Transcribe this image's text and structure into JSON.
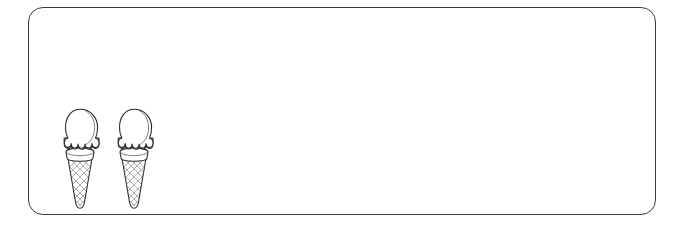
{
  "canvas": {
    "width": 680,
    "height": 230,
    "background_color": "#ffffff"
  },
  "panel": {
    "name": "answer-box",
    "shape": "rounded-rectangle",
    "border_color": "#3a3a3a",
    "fill_color": "#ffffff",
    "border_width_px": 1,
    "corner_radius_px": 15,
    "left_px": 28,
    "top_px": 7,
    "width_px": 628,
    "height_px": 208
  },
  "content": {
    "item_label": "ice-cream-cone",
    "item_count": "2",
    "alignment": "bottom-left",
    "icons": [
      {
        "index": "1",
        "name": "ice-cream-cone-icon",
        "left_px": 28,
        "top_px": 100,
        "width_px": 46,
        "height_px": 102,
        "outline_color": "#2b2b2b",
        "fill_color": "#ffffff",
        "hatch_color": "#6e6e6e"
      },
      {
        "index": "2",
        "name": "ice-cream-cone-icon",
        "left_px": 82,
        "top_px": 100,
        "width_px": 46,
        "height_px": 102,
        "outline_color": "#2b2b2b",
        "fill_color": "#ffffff",
        "hatch_color": "#6e6e6e"
      }
    ]
  },
  "accessibility": {
    "panel_description": "Empty bordered answer area containing two line-art ice cream cones",
    "icon_description": "Ice cream cone with a single rounded scoop and a cross-hatched waffle cone"
  }
}
